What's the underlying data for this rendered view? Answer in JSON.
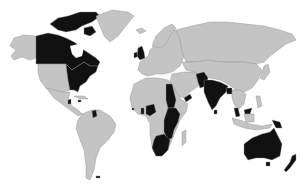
{
  "map": {
    "type": "world-choropleth",
    "colors": {
      "background": "#ffffff",
      "land_default": "#c4c4c4",
      "land_highlight": "#111111",
      "border": "#8a8a8a"
    },
    "highlighted_regions": [
      "Canada",
      "United States (eastern)",
      "United Kingdom",
      "Ireland",
      "Jamaica",
      "Belize",
      "Guyana",
      "Ghana",
      "Nigeria",
      "Cameroon",
      "Sierra Leone",
      "Egypt",
      "Sudan",
      "Kenya",
      "Uganda",
      "Tanzania",
      "Zambia",
      "Malawi",
      "Mozambique",
      "Botswana",
      "Namibia",
      "South Africa",
      "Pakistan",
      "India",
      "Bangladesh",
      "Sri Lanka",
      "Malaysia",
      "Singapore",
      "Papua New Guinea",
      "Australia",
      "New Zealand"
    ]
  }
}
